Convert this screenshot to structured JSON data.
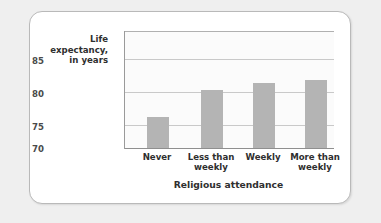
{
  "chart_data": {
    "type": "bar",
    "title": "",
    "xlabel": "Religious attendance",
    "ylabel": "Life expectancy,\nin years",
    "categories": [
      "Never",
      "Less than\nweekly",
      "Weekly",
      "More than\nweekly"
    ],
    "values": [
      75.2,
      79.7,
      80.9,
      81.4
    ],
    "ylim": [
      70,
      87
    ],
    "yticks": [
      "85",
      "80",
      "75",
      "70"
    ],
    "ytick_values": [
      85,
      80,
      75,
      70
    ],
    "grid": true,
    "legend": "none",
    "bar_color": "#b4b4b4",
    "gridline_color": "#c9c9c9",
    "axis_color": "#9a9a9a",
    "plot_background": "#fbfbfb",
    "card_background": "#ffffff",
    "page_background": "#efefef"
  }
}
